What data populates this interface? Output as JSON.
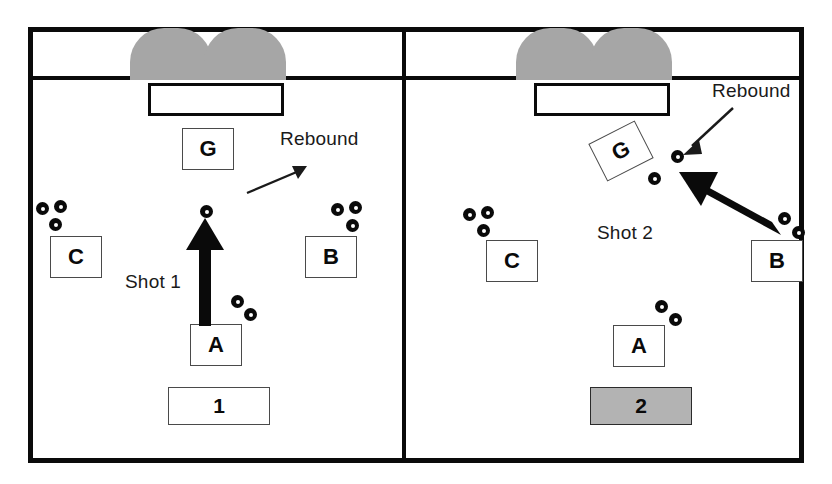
{
  "diagram": {
    "colors": {
      "line": "#0a0a0a",
      "cage_fill": "#a6a6a6",
      "shaded_box": "#b3b3b3",
      "background": "#ffffff"
    }
  },
  "panels": [
    {
      "id": "panel-1",
      "number_label": "1",
      "number_shaded": false,
      "goalie_label": "G",
      "players": [
        {
          "name": "C",
          "label": "C",
          "pucks": 3
        },
        {
          "name": "B",
          "label": "B",
          "pucks": 3
        },
        {
          "name": "A",
          "label": "A",
          "pucks": 2
        }
      ],
      "annotations": [
        {
          "name": "shot-1",
          "text": "Shot 1"
        },
        {
          "name": "rebound-1",
          "text": "Rebound"
        }
      ]
    },
    {
      "id": "panel-2",
      "number_label": "2",
      "number_shaded": true,
      "goalie_label": "G",
      "players": [
        {
          "name": "C",
          "label": "C",
          "pucks": 3
        },
        {
          "name": "B",
          "label": "B",
          "pucks": 2
        },
        {
          "name": "A",
          "label": "A",
          "pucks": 2
        }
      ],
      "annotations": [
        {
          "name": "shot-2",
          "text": "Shot 2"
        },
        {
          "name": "rebound-2",
          "text": "Rebound"
        }
      ]
    }
  ]
}
